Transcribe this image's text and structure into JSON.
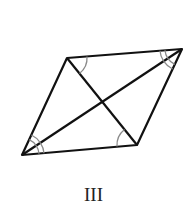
{
  "figure": {
    "label": "III",
    "shape": "rhombus with both diagonals",
    "vertices": {
      "top_left": [
        67,
        58
      ],
      "top_right": [
        182,
        49
      ],
      "bottom_right": [
        137,
        145
      ],
      "bottom_left": [
        22,
        155
      ]
    },
    "angle_marks": [
      {
        "vertex": "top_left",
        "arcs": 1
      },
      {
        "vertex": "bottom_right",
        "arcs": 1
      },
      {
        "vertex": "top_right",
        "arcs": 2
      },
      {
        "vertex": "bottom_left",
        "arcs": 2
      }
    ],
    "colors": {
      "stroke": "#111111",
      "arc": "#888888"
    }
  }
}
